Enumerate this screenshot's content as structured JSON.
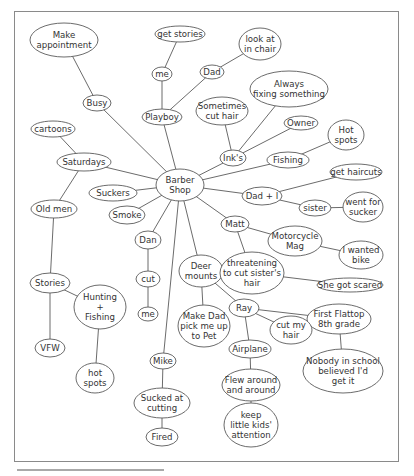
{
  "diagram": {
    "type": "mind-map",
    "central_node": "barber",
    "colors": {
      "line": "#5a5a5a",
      "text": "#333333",
      "frame": "#8a8a8a",
      "background": "#ffffff"
    },
    "nodes": [
      {
        "id": "barber",
        "lines": [
          "Barber",
          "Shop"
        ],
        "x": 180,
        "y": 185,
        "rx": 24,
        "ry": 16
      },
      {
        "id": "make_appt",
        "lines": [
          "Make",
          "appointment"
        ],
        "x": 64,
        "y": 40,
        "rx": 34,
        "ry": 17
      },
      {
        "id": "busy",
        "lines": [
          "Busy"
        ],
        "x": 97,
        "y": 103,
        "rx": 14,
        "ry": 8
      },
      {
        "id": "get_stories",
        "lines": [
          "get stories"
        ],
        "x": 180,
        "y": 34,
        "rx": 25,
        "ry": 8
      },
      {
        "id": "me_top",
        "lines": [
          "me"
        ],
        "x": 162,
        "y": 74,
        "rx": 10,
        "ry": 7
      },
      {
        "id": "dad",
        "lines": [
          "Dad"
        ],
        "x": 212,
        "y": 72,
        "rx": 12,
        "ry": 7
      },
      {
        "id": "look_chair",
        "lines": [
          "look at",
          "in chair"
        ],
        "x": 260,
        "y": 44,
        "rx": 21,
        "ry": 16
      },
      {
        "id": "playboy",
        "lines": [
          "Playboy"
        ],
        "x": 162,
        "y": 117,
        "rx": 20,
        "ry": 8
      },
      {
        "id": "always_fixing",
        "lines": [
          "Always",
          "fixing something"
        ],
        "x": 289,
        "y": 89,
        "rx": 39,
        "ry": 18
      },
      {
        "id": "sometimes_cut",
        "lines": [
          "Sometimes",
          "cut hair"
        ],
        "x": 222,
        "y": 111,
        "rx": 26,
        "ry": 14
      },
      {
        "id": "owner",
        "lines": [
          "Owner"
        ],
        "x": 301,
        "y": 123,
        "rx": 17,
        "ry": 7
      },
      {
        "id": "hot_spots_r",
        "lines": [
          "Hot",
          "spots"
        ],
        "x": 346,
        "y": 135,
        "rx": 18,
        "ry": 15
      },
      {
        "id": "inks",
        "lines": [
          "Ink's"
        ],
        "x": 233,
        "y": 158,
        "rx": 13,
        "ry": 8
      },
      {
        "id": "fishing",
        "lines": [
          "Fishing"
        ],
        "x": 288,
        "y": 160,
        "rx": 21,
        "ry": 8
      },
      {
        "id": "get_haircuts",
        "lines": [
          "get haircuts"
        ],
        "x": 356,
        "y": 172,
        "rx": 26,
        "ry": 8
      },
      {
        "id": "dad_i",
        "lines": [
          "Dad + I"
        ],
        "x": 262,
        "y": 196,
        "rx": 20,
        "ry": 9
      },
      {
        "id": "sister",
        "lines": [
          "sister"
        ],
        "x": 315,
        "y": 208,
        "rx": 16,
        "ry": 8
      },
      {
        "id": "went_sucker",
        "lines": [
          "went for",
          "sucker"
        ],
        "x": 363,
        "y": 207,
        "rx": 20,
        "ry": 15
      },
      {
        "id": "cartoons",
        "lines": [
          "cartoons"
        ],
        "x": 53,
        "y": 129,
        "rx": 22,
        "ry": 8
      },
      {
        "id": "saturdays",
        "lines": [
          "Saturdays"
        ],
        "x": 84,
        "y": 162,
        "rx": 27,
        "ry": 9
      },
      {
        "id": "suckers",
        "lines": [
          "Suckers"
        ],
        "x": 113,
        "y": 193,
        "rx": 24,
        "ry": 8
      },
      {
        "id": "old_men",
        "lines": [
          "Old men"
        ],
        "x": 54,
        "y": 209,
        "rx": 23,
        "ry": 9
      },
      {
        "id": "smoke",
        "lines": [
          "Smoke"
        ],
        "x": 127,
        "y": 215,
        "rx": 18,
        "ry": 9
      },
      {
        "id": "matt",
        "lines": [
          "Matt"
        ],
        "x": 235,
        "y": 224,
        "rx": 14,
        "ry": 8
      },
      {
        "id": "motorcycle",
        "lines": [
          "Motorcycle",
          "Mag"
        ],
        "x": 295,
        "y": 241,
        "rx": 27,
        "ry": 15
      },
      {
        "id": "dan",
        "lines": [
          "Dan"
        ],
        "x": 148,
        "y": 240,
        "rx": 13,
        "ry": 9
      },
      {
        "id": "wanted_bike",
        "lines": [
          "I wanted",
          "bike"
        ],
        "x": 361,
        "y": 255,
        "rx": 22,
        "ry": 14
      },
      {
        "id": "deer_mounts",
        "lines": [
          "Deer",
          "mounts"
        ],
        "x": 201,
        "y": 271,
        "rx": 22,
        "ry": 16
      },
      {
        "id": "threatening",
        "lines": [
          "threatening",
          "to cut sister's",
          "hair"
        ],
        "x": 252,
        "y": 273,
        "rx": 32,
        "ry": 21
      },
      {
        "id": "cut",
        "lines": [
          "cut"
        ],
        "x": 148,
        "y": 279,
        "rx": 12,
        "ry": 8
      },
      {
        "id": "stories",
        "lines": [
          "Stories"
        ],
        "x": 50,
        "y": 283,
        "rx": 20,
        "ry": 10
      },
      {
        "id": "scared",
        "lines": [
          "She got scared"
        ],
        "x": 350,
        "y": 285,
        "rx": 33,
        "ry": 7
      },
      {
        "id": "hunting",
        "lines": [
          "Hunting",
          "+",
          "Fishing"
        ],
        "x": 100,
        "y": 307,
        "rx": 26,
        "ry": 22
      },
      {
        "id": "me_mid",
        "lines": [
          "me"
        ],
        "x": 148,
        "y": 314,
        "rx": 10,
        "ry": 7
      },
      {
        "id": "ray",
        "lines": [
          "Ray"
        ],
        "x": 244,
        "y": 308,
        "rx": 15,
        "ry": 9
      },
      {
        "id": "first_flattop",
        "lines": [
          "First Flattop",
          "8th grade"
        ],
        "x": 339,
        "y": 319,
        "rx": 32,
        "ry": 15
      },
      {
        "id": "make_dad",
        "lines": [
          "Make Dad",
          "pick me up",
          "to Pet"
        ],
        "x": 204,
        "y": 326,
        "rx": 26,
        "ry": 21
      },
      {
        "id": "cut_my_hair",
        "lines": [
          "cut my",
          "hair"
        ],
        "x": 291,
        "y": 330,
        "rx": 21,
        "ry": 14
      },
      {
        "id": "airplane",
        "lines": [
          "Airplane"
        ],
        "x": 250,
        "y": 349,
        "rx": 21,
        "ry": 9
      },
      {
        "id": "vfw",
        "lines": [
          "VFW"
        ],
        "x": 50,
        "y": 348,
        "rx": 15,
        "ry": 9
      },
      {
        "id": "nobody",
        "lines": [
          "Nobody in school",
          "believed I'd",
          "get it"
        ],
        "x": 343,
        "y": 371,
        "rx": 40,
        "ry": 22
      },
      {
        "id": "mike",
        "lines": [
          "Mike"
        ],
        "x": 163,
        "y": 361,
        "rx": 13,
        "ry": 8
      },
      {
        "id": "hot_spots_l",
        "lines": [
          "hot",
          "spots"
        ],
        "x": 95,
        "y": 378,
        "rx": 19,
        "ry": 15
      },
      {
        "id": "flew",
        "lines": [
          "Flew around",
          "and around"
        ],
        "x": 251,
        "y": 385,
        "rx": 29,
        "ry": 16
      },
      {
        "id": "sucked",
        "lines": [
          "Sucked at",
          "cutting"
        ],
        "x": 162,
        "y": 403,
        "rx": 28,
        "ry": 15
      },
      {
        "id": "keep_kids",
        "lines": [
          "keep",
          "little kids'",
          "attention"
        ],
        "x": 251,
        "y": 425,
        "rx": 27,
        "ry": 22
      },
      {
        "id": "fired",
        "lines": [
          "Fired"
        ],
        "x": 162,
        "y": 437,
        "rx": 16,
        "ry": 9
      }
    ],
    "edges": [
      [
        "make_appt",
        "busy"
      ],
      [
        "busy",
        "barber"
      ],
      [
        "get_stories",
        "me_top"
      ],
      [
        "me_top",
        "playboy"
      ],
      [
        "dad",
        "playboy"
      ],
      [
        "dad",
        "look_chair"
      ],
      [
        "playboy",
        "barber"
      ],
      [
        "sometimes_cut",
        "inks"
      ],
      [
        "always_fixing",
        "inks"
      ],
      [
        "owner",
        "inks"
      ],
      [
        "inks",
        "barber"
      ],
      [
        "fishing",
        "barber"
      ],
      [
        "fishing",
        "hot_spots_r"
      ],
      [
        "dad_i",
        "barber"
      ],
      [
        "dad_i",
        "get_haircuts"
      ],
      [
        "dad_i",
        "sister"
      ],
      [
        "sister",
        "went_sucker"
      ],
      [
        "cartoons",
        "saturdays"
      ],
      [
        "saturdays",
        "barber"
      ],
      [
        "saturdays",
        "old_men"
      ],
      [
        "old_men",
        "stories"
      ],
      [
        "stories",
        "vfw"
      ],
      [
        "stories",
        "hunting"
      ],
      [
        "hunting",
        "hot_spots_l"
      ],
      [
        "suckers",
        "barber"
      ],
      [
        "smoke",
        "barber"
      ],
      [
        "dan",
        "barber"
      ],
      [
        "dan",
        "cut"
      ],
      [
        "cut",
        "me_mid"
      ],
      [
        "mike",
        "barber"
      ],
      [
        "mike",
        "sucked"
      ],
      [
        "sucked",
        "fired"
      ],
      [
        "deer_mounts",
        "barber"
      ],
      [
        "deer_mounts",
        "make_dad"
      ],
      [
        "deer_mounts",
        "ray"
      ],
      [
        "ray",
        "first_flattop"
      ],
      [
        "ray",
        "cut_my_hair"
      ],
      [
        "ray",
        "airplane"
      ],
      [
        "first_flattop",
        "nobody"
      ],
      [
        "airplane",
        "flew"
      ],
      [
        "flew",
        "keep_kids"
      ],
      [
        "matt",
        "barber"
      ],
      [
        "matt",
        "motorcycle"
      ],
      [
        "motorcycle",
        "wanted_bike"
      ],
      [
        "matt",
        "threatening"
      ],
      [
        "threatening",
        "scared"
      ]
    ]
  }
}
